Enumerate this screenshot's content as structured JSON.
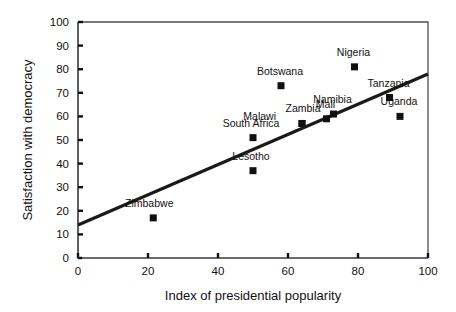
{
  "chart_data": {
    "type": "scatter",
    "title": "",
    "xlabel": "Index of presidential popularity",
    "ylabel": "Satisfaction with democracy",
    "xlim": [
      0,
      100
    ],
    "ylim": [
      0,
      100
    ],
    "xticks": [
      0,
      20,
      40,
      60,
      80,
      100
    ],
    "yticks": [
      0,
      10,
      20,
      30,
      40,
      50,
      60,
      70,
      80,
      90,
      100
    ],
    "grid": false,
    "legend": "none",
    "marker": "filled-square",
    "marker_color": "#101010",
    "line_color": "#1a1a1a",
    "points": [
      {
        "label": "Zimbabwe",
        "x": 21.5,
        "y": 17,
        "label_dx": -4,
        "label_dy": -11
      },
      {
        "label": "Lesotho",
        "x": 50,
        "y": 37,
        "label_dx": -2,
        "label_dy": -11
      },
      {
        "label": "South Africa",
        "x": 50,
        "y": 51,
        "label_dx": -2,
        "label_dy": -11
      },
      {
        "label": "Botswana",
        "x": 58,
        "y": 73,
        "label_dx": -1,
        "label_dy": -11
      },
      {
        "label": "Zambia",
        "x": 64,
        "y": 57,
        "label_dx": 1,
        "label_dy": -11
      },
      {
        "label": "Malawi",
        "x": 64,
        "y": 57,
        "label_dx": -26,
        "label_dy": -3
      },
      {
        "label": "Mali",
        "x": 71,
        "y": 59,
        "label_dx": -1,
        "label_dy": -11
      },
      {
        "label": "Namibia",
        "x": 73,
        "y": 61,
        "label_dx": -1,
        "label_dy": -11
      },
      {
        "label": "Nigeria",
        "x": 79,
        "y": 81,
        "label_dx": -1,
        "label_dy": -11
      },
      {
        "label": "Tanzania",
        "x": 89,
        "y": 68,
        "label_dx": -1,
        "label_dy": -11
      },
      {
        "label": "Uganda",
        "x": 92,
        "y": 60,
        "label_dx": -1,
        "label_dy": -11
      }
    ],
    "fit_line": {
      "x0": 0,
      "y0": 14,
      "x1": 100,
      "y1": 78
    }
  }
}
